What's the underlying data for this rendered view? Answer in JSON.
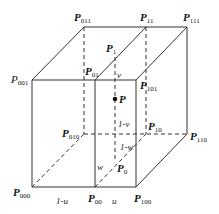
{
  "diagram": {
    "type": "trilinear-interpolation-cube",
    "vertices": [
      {
        "id": "P000",
        "base": "P",
        "sub": "000",
        "x": 32,
        "y": 187,
        "lx": 13,
        "ly": 196,
        "bold": true
      },
      {
        "id": "P100",
        "base": "P",
        "sub": "100",
        "x": 136,
        "y": 187,
        "lx": 134,
        "ly": 202,
        "bold": true
      },
      {
        "id": "P010",
        "base": "P",
        "sub": "010",
        "x": 84,
        "y": 134,
        "lx": 62,
        "ly": 137,
        "bold": true
      },
      {
        "id": "P110",
        "base": "P",
        "sub": "110",
        "x": 187,
        "y": 134,
        "lx": 190,
        "ly": 140,
        "bold": true
      },
      {
        "id": "P001",
        "base": "P",
        "sub": "001",
        "x": 32,
        "y": 80,
        "lx": 11,
        "ly": 83,
        "bold": false
      },
      {
        "id": "P101",
        "base": "P",
        "sub": "101",
        "x": 136,
        "y": 80,
        "lx": 140,
        "ly": 89,
        "bold": true
      },
      {
        "id": "P011",
        "base": "P",
        "sub": "011",
        "x": 84,
        "y": 27,
        "lx": 74,
        "ly": 21,
        "bold": true
      },
      {
        "id": "P111",
        "base": "P",
        "sub": "111",
        "x": 187,
        "y": 27,
        "lx": 183,
        "ly": 21,
        "bold": true
      }
    ],
    "interpolated_points": [
      {
        "id": "P00",
        "base": "P",
        "sub": "00",
        "x": 95,
        "y": 187,
        "lx": 88,
        "ly": 202,
        "bold": true
      },
      {
        "id": "P01",
        "base": "P",
        "sub": "01",
        "x": 95,
        "y": 80,
        "lx": 85,
        "ly": 75,
        "bold": true
      },
      {
        "id": "P10",
        "base": "P",
        "sub": "10",
        "x": 146,
        "y": 134,
        "lx": 148,
        "ly": 130,
        "bold": true
      },
      {
        "id": "P11",
        "base": "P",
        "sub": "11",
        "x": 146,
        "y": 27,
        "lx": 140,
        "ly": 21,
        "bold": true
      },
      {
        "id": "P0",
        "base": "P",
        "sub": "0",
        "x": 115,
        "y": 161,
        "lx": 117,
        "ly": 172,
        "bold": true
      },
      {
        "id": "P1",
        "base": "P",
        "sub": "1",
        "x": 115,
        "y": 57,
        "lx": 106,
        "ly": 52,
        "bold": true
      },
      {
        "id": "P",
        "base": "P",
        "sub": "",
        "x": 115,
        "y": 99,
        "lx": 119,
        "ly": 103,
        "bold": true
      }
    ],
    "parameter_labels": [
      {
        "text": "1-u",
        "x": 56,
        "y": 204
      },
      {
        "text": "u",
        "x": 112,
        "y": 204
      },
      {
        "text": "v",
        "x": 117,
        "y": 78
      },
      {
        "text": "1-v",
        "x": 118,
        "y": 127
      },
      {
        "text": "1-w",
        "x": 120,
        "y": 150
      },
      {
        "text": "w",
        "x": 97,
        "y": 170
      }
    ],
    "solid_edges": [
      [
        32,
        80,
        136,
        80
      ],
      [
        32,
        80,
        32,
        187
      ],
      [
        32,
        187,
        136,
        187
      ],
      [
        136,
        80,
        136,
        187
      ],
      [
        32,
        80,
        84,
        27
      ],
      [
        84,
        27,
        187,
        27
      ],
      [
        187,
        27,
        187,
        134
      ],
      [
        136,
        80,
        187,
        27
      ],
      [
        136,
        187,
        187,
        134
      ],
      [
        95,
        80,
        95,
        187
      ],
      [
        95,
        80,
        146,
        27
      ]
    ],
    "dashed_edges": [
      [
        84,
        27,
        84,
        134
      ],
      [
        84,
        134,
        187,
        134
      ],
      [
        32,
        187,
        84,
        134
      ],
      [
        146,
        27,
        146,
        134
      ],
      [
        95,
        187,
        146,
        134
      ],
      [
        115,
        57,
        115,
        161
      ]
    ]
  }
}
